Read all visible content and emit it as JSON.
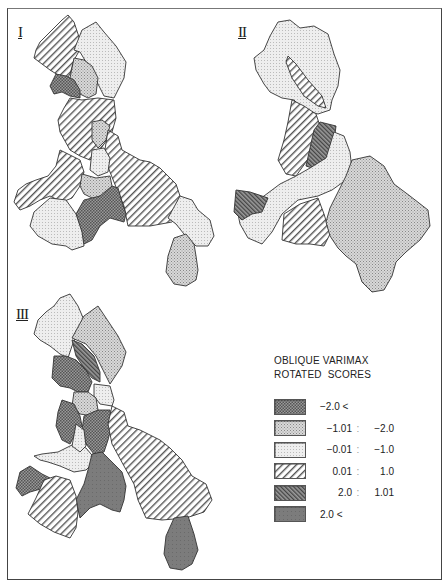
{
  "figure": {
    "maps": [
      {
        "id": "I",
        "label": "I"
      },
      {
        "id": "II",
        "label": "II"
      },
      {
        "id": "III",
        "label": "III"
      }
    ],
    "legend": {
      "title_line1": "OBLIQUE VARIMAX",
      "title_line2": "ROTATED  SCORES",
      "items": [
        {
          "from": "−2.0 <",
          "sep": "",
          "to": "",
          "pattern": "dense-crosshatch",
          "color": "#8a8a8a"
        },
        {
          "from": "−1.01",
          "sep": ":",
          "to": "−2.0",
          "pattern": "medium-dots",
          "color": "#c9c9c9"
        },
        {
          "from": "−0.01",
          "sep": ":",
          "to": "−1.0",
          "pattern": "light-dots",
          "color": "#e6e6e6"
        },
        {
          "from": "0.01",
          "sep": ":",
          "to": "1.0",
          "pattern": "diagonal-hatch",
          "color": "#ffffff"
        },
        {
          "from": "2.0",
          "sep": ":",
          "to": "1.01",
          "pattern": "dense-diagonal-hatch",
          "color": "#777777"
        },
        {
          "from": "2.0 <",
          "sep": "",
          "to": "",
          "pattern": "solid-dark",
          "color": "#7a7a7a"
        }
      ]
    }
  }
}
